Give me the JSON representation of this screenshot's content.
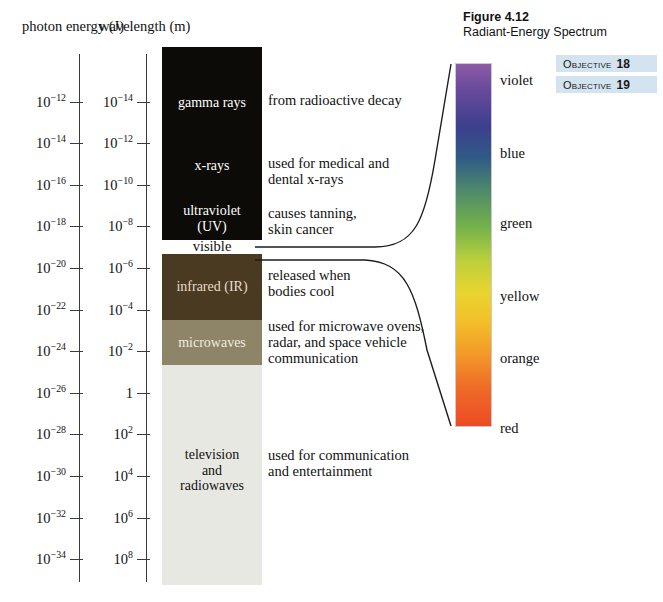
{
  "figure": {
    "title": "Figure 4.12",
    "subtitle": "Radiant-Energy Spectrum"
  },
  "objectives": [
    {
      "word": "Objective",
      "number": "18"
    },
    {
      "word": "Objective",
      "number": "19"
    }
  ],
  "axes": {
    "energy": {
      "header": "photon\nenergy (J)",
      "unit": "J",
      "ticks": [
        "10⁻¹²",
        "10⁻¹⁴",
        "10⁻¹⁶",
        "10⁻¹⁸",
        "10⁻²⁰",
        "10⁻²²",
        "10⁻²⁴",
        "10⁻²⁶",
        "10⁻²⁸",
        "10⁻³⁰",
        "10⁻³²",
        "10⁻³⁴"
      ],
      "exponents": [
        -12,
        -14,
        -16,
        -18,
        -20,
        -22,
        -24,
        -26,
        -28,
        -30,
        -32,
        -34
      ]
    },
    "wavelength": {
      "header": "wavelength\n(m)",
      "unit": "m",
      "ticks": [
        "10⁻¹⁴",
        "10⁻¹²",
        "10⁻¹⁰",
        "10⁻⁸",
        "10⁻⁶",
        "10⁻⁴",
        "10⁻²",
        "1",
        "10²",
        "10⁴",
        "10⁶",
        "10⁸"
      ],
      "exponents": [
        -14,
        -12,
        -10,
        -8,
        -6,
        -4,
        -2,
        0,
        2,
        4,
        6,
        8
      ]
    }
  },
  "chart_data": {
    "type": "bar",
    "title": "Radiant-Energy Spectrum",
    "xlabel": "",
    "ylabel": "wavelength (m) / photon energy (J)",
    "bands": [
      {
        "name": "gamma rays",
        "label": "gamma rays",
        "description": "from radioactive decay",
        "color": "#0d0b08",
        "label_color": "#ffffff",
        "top": 47,
        "height": 193,
        "label_y": 95,
        "desc_y": 92
      },
      {
        "name": "x-rays",
        "label": "x-rays",
        "description": "used for medical and\ndental x-rays",
        "color": "#0d0b08",
        "label_color": "#ffffff",
        "top": 47,
        "height": 193,
        "label_y": 158,
        "desc_y": 155
      },
      {
        "name": "ultraviolet",
        "label": "ultraviolet\n(UV)",
        "description": "causes tanning,\nskin cancer",
        "color": "#0d0b08",
        "label_color": "#ffffff",
        "top": 47,
        "height": 193,
        "label_y": 203,
        "desc_y": 205
      },
      {
        "name": "visible",
        "label": "visible",
        "description": "",
        "color": "#ffffff",
        "label_color": "#111111",
        "top": 240,
        "height": 14,
        "label_y": 238,
        "desc_y": 0
      },
      {
        "name": "infrared",
        "label": "infrared (IR)",
        "description": "released when\nbodies cool",
        "color": "#4a3a22",
        "label_color": "#e7ddc9",
        "top": 254,
        "height": 66,
        "label_y": 279,
        "desc_y": 267
      },
      {
        "name": "microwaves",
        "label": "microwaves",
        "description": "used for microwave ovens,\nradar, and space vehicle\ncommunication",
        "color": "#8e8468",
        "label_color": "#f0ece0",
        "top": 320,
        "height": 45,
        "label_y": 335,
        "desc_y": 318
      },
      {
        "name": "television-and-radiowaves",
        "label": "television\nand\nradiowaves",
        "description": "used for communication\nand entertainment",
        "color": "#e8e8e2",
        "label_color": "#111111",
        "top": 365,
        "height": 220,
        "label_y": 447,
        "desc_y": 447
      }
    ],
    "visible_spectrum": {
      "colors": [
        "violet",
        "blue",
        "green",
        "yellow",
        "orange",
        "red"
      ],
      "label_positions": [
        72,
        145,
        215,
        288,
        350,
        420
      ],
      "gradient": [
        "#8e5ba6",
        "#3e3f8e",
        "#74b24a",
        "#e8d52e",
        "#f29a28",
        "#ed4a23"
      ],
      "bar_top": 63,
      "bar_height": 364
    }
  }
}
